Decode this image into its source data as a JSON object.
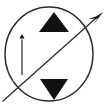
{
  "figure": {
    "title": "Circle with opposing triangles and directional arrows",
    "background_color": "#ffffff",
    "stroke_color": "#2b2b2b",
    "fill_color": "#111111",
    "width": 108,
    "height": 109
  },
  "elements": {
    "circle": {
      "name": "outline circle",
      "center_x": 49,
      "center_y": 54,
      "radius_x": 44,
      "radius_y": 47,
      "stroke_width": 1.4,
      "filled": false
    },
    "triangle_up": {
      "name": "upward triangle",
      "direction": "up",
      "apex_x": 54,
      "apex_y": 12,
      "base_left_x": 39,
      "base_right_x": 69,
      "base_y": 32,
      "filled": true
    },
    "triangle_down": {
      "name": "downward triangle",
      "direction": "down",
      "apex_x": 54,
      "apex_y": 100,
      "base_left_x": 40,
      "base_right_x": 68,
      "base_y": 79,
      "filled": true
    },
    "vertical_arrow": {
      "name": "vertical up arrow",
      "direction": "up",
      "tail_x": 22,
      "tail_y": 75,
      "head_x": 22,
      "head_y": 34,
      "stroke_width": 1.2,
      "head_width": 5,
      "head_length": 9
    },
    "diagonal_arrow": {
      "name": "diagonal up-right arrow",
      "direction": "up-right",
      "tail_x": 3,
      "tail_y": 101,
      "head_x": 103,
      "head_y": 12,
      "stroke_width": 1.3,
      "head_width": 6,
      "head_length": 16
    }
  },
  "labels": {
    "figure_caption": "",
    "annotations": []
  }
}
